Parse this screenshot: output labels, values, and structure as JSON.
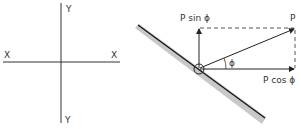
{
  "axes_panel": {
    "x_left_label": "X",
    "x_right_label": "X",
    "y_top_label": "Y",
    "y_bottom_label": "Y"
  },
  "vector_panel": {
    "resultant_label": "P",
    "vertical_component_label": "P sin ϕ",
    "horizontal_component_label": "P cos ϕ",
    "angle_label": "ϕ"
  },
  "colors": {
    "line": "#333333",
    "beam_fill": "#c8c8c8",
    "beam_edge": "#111111"
  }
}
